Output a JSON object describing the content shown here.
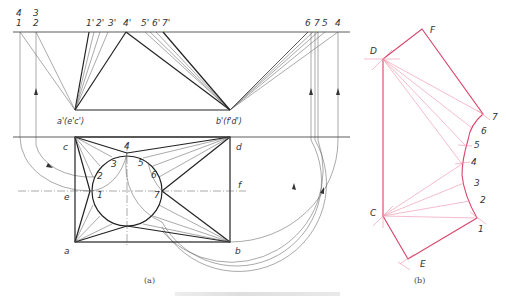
{
  "figure": {
    "panel_a": {
      "caption": "(a)",
      "top_view_labels": {
        "left_stack_top": [
          "4",
          "1"
        ],
        "left_stack_2": [
          "3",
          "2"
        ],
        "primes": [
          "1'",
          "2'",
          "3'",
          "4'",
          "5'",
          "6'",
          "7'"
        ],
        "right": [
          "6",
          "7",
          "5",
          "4"
        ]
      },
      "vertex_labels": {
        "a_prime": "a'(e'c')",
        "b_prime": "b'(f'd')"
      },
      "plan_labels": {
        "c": "c",
        "d": "d",
        "e": "e",
        "f": "f",
        "a": "a",
        "b": "b",
        "p1": "1",
        "p2": "2",
        "p3": "3",
        "p4": "4",
        "p5": "5",
        "p6": "6",
        "p7": "7"
      }
    },
    "panel_b": {
      "caption": "(b)",
      "labels": {
        "D": "D",
        "F": "F",
        "C": "C",
        "E": "E",
        "p1": "1",
        "p2": "2",
        "p3": "3",
        "p4": "4",
        "p5": "5",
        "p6": "6",
        "p7": "7"
      },
      "colors": {
        "outline": "#d9456b",
        "construction": "#ee8fa8"
      }
    },
    "colors": {
      "ink": "#222222",
      "background": "#ffffff"
    }
  }
}
